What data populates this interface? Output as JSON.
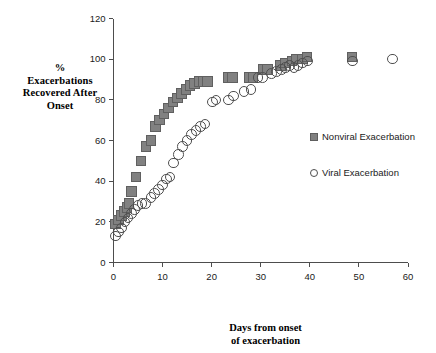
{
  "chart_data": {
    "type": "scatter",
    "title": "",
    "xlabel": "Days from onset of exacerbation",
    "xlabel_lines": [
      "Days from onset",
      "of exacerbation"
    ],
    "ylabel": "% Exacerbations Recovered After Onset",
    "ylabel_lines": [
      "%",
      "Exacerbations",
      "Recovered After",
      "Onset"
    ],
    "xlim": [
      0,
      60
    ],
    "ylim": [
      0,
      120
    ],
    "xticks": [
      0,
      10,
      20,
      30,
      40,
      50,
      60
    ],
    "yticks": [
      0,
      20,
      40,
      60,
      80,
      100,
      120
    ],
    "grid": false,
    "legend_position": "right-middle",
    "series": [
      {
        "name": "Nonviral Exacerbation",
        "marker": "square",
        "color": "#818181",
        "edge_color": "#606060",
        "points": [
          [
            0.4,
            19
          ],
          [
            1.0,
            21
          ],
          [
            1.6,
            23
          ],
          [
            2.2,
            25
          ],
          [
            2.8,
            27
          ],
          [
            3.2,
            29
          ],
          [
            3.7,
            35
          ],
          [
            4.6,
            42
          ],
          [
            5.6,
            50
          ],
          [
            6.6,
            57
          ],
          [
            7.6,
            60
          ],
          [
            8.6,
            67
          ],
          [
            9.4,
            70
          ],
          [
            10.3,
            73
          ],
          [
            11.2,
            76
          ],
          [
            12.1,
            79
          ],
          [
            13.0,
            81
          ],
          [
            13.9,
            83
          ],
          [
            14.8,
            85
          ],
          [
            15.6,
            87
          ],
          [
            16.5,
            88
          ],
          [
            17.4,
            89
          ],
          [
            18.3,
            89
          ],
          [
            19.2,
            89
          ],
          [
            23.4,
            91
          ],
          [
            24.2,
            91
          ],
          [
            27.6,
            91
          ],
          [
            28.4,
            91
          ],
          [
            30.6,
            95
          ],
          [
            31.4,
            95
          ],
          [
            34.0,
            97
          ],
          [
            35.0,
            98
          ],
          [
            36.4,
            99
          ],
          [
            37.2,
            100
          ],
          [
            38.5,
            100
          ],
          [
            39.4,
            101
          ],
          [
            48.6,
            101
          ]
        ]
      },
      {
        "name": "Viral Exacerbation",
        "marker": "circle",
        "color": "#ffffff",
        "edge_color": "#4f4f4f",
        "points": [
          [
            0.4,
            13
          ],
          [
            1.0,
            15
          ],
          [
            1.6,
            17
          ],
          [
            2.3,
            20
          ],
          [
            3.0,
            22
          ],
          [
            3.7,
            24
          ],
          [
            4.3,
            26
          ],
          [
            5.0,
            28
          ],
          [
            5.8,
            29
          ],
          [
            6.5,
            29
          ],
          [
            7.6,
            32
          ],
          [
            8.4,
            34
          ],
          [
            9.2,
            36
          ],
          [
            10.0,
            38
          ],
          [
            10.8,
            41
          ],
          [
            11.5,
            42
          ],
          [
            12.2,
            49
          ],
          [
            13.2,
            53
          ],
          [
            14.1,
            57
          ],
          [
            15.0,
            60
          ],
          [
            15.9,
            63
          ],
          [
            16.8,
            65
          ],
          [
            17.7,
            67
          ],
          [
            18.6,
            68
          ],
          [
            20.2,
            79
          ],
          [
            20.9,
            80
          ],
          [
            23.4,
            80
          ],
          [
            24.4,
            82
          ],
          [
            26.6,
            84
          ],
          [
            28.0,
            85
          ],
          [
            29.4,
            91
          ],
          [
            30.4,
            91
          ],
          [
            32.2,
            93
          ],
          [
            33.2,
            94
          ],
          [
            34.2,
            95
          ],
          [
            35.0,
            96
          ],
          [
            35.9,
            97
          ],
          [
            36.8,
            96
          ],
          [
            37.6,
            97
          ],
          [
            38.5,
            98
          ],
          [
            39.5,
            99
          ],
          [
            48.7,
            99
          ],
          [
            56.8,
            100
          ]
        ]
      }
    ]
  },
  "axes": {
    "x_tick_labels": [
      "0",
      "10",
      "20",
      "30",
      "40",
      "50",
      "60"
    ],
    "y_tick_labels": [
      "0",
      "20",
      "40",
      "60",
      "80",
      "100",
      "120"
    ]
  },
  "legend": {
    "items": [
      {
        "label": "Nonviral Exacerbation",
        "marker": "square-marker-icon"
      },
      {
        "label": "Viral Exacerbation",
        "marker": "circle-marker-icon"
      }
    ]
  },
  "colors": {
    "square_fill": "#818181",
    "square_edge": "#606060",
    "circle_edge": "#4f4f4f",
    "axis": "#4d4d4d",
    "text": "#1a1a1a",
    "background": "#ffffff"
  }
}
